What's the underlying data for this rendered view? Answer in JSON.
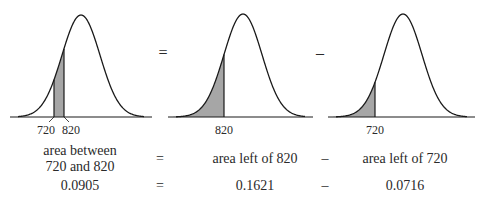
{
  "figure": {
    "panels": [
      {
        "id": "between",
        "shade": "between",
        "labels": [
          "720",
          "820"
        ]
      },
      {
        "id": "left-820",
        "shade": "left",
        "labels": [
          "820"
        ]
      },
      {
        "id": "left-720",
        "shade": "left",
        "labels": [
          "720"
        ]
      }
    ],
    "operators": {
      "top_eq": "=",
      "top_minus": "–"
    },
    "colors": {
      "curve": "#1a1a1a",
      "shade": "#a6a6a6",
      "background": "#ffffff"
    }
  },
  "equation_text": {
    "col1_line1": "area between",
    "col1_line2": "720 and 820",
    "eq": "=",
    "col2": "area left of 820",
    "minus": "–",
    "col3": "area left of 720"
  },
  "equation_values": {
    "col1": "0.0905",
    "eq": "=",
    "col2": "0.1621",
    "minus": "–",
    "col3": "0.0716"
  },
  "chart_data": {
    "type": "area",
    "panels": [
      {
        "shaded_region": "720 to 820",
        "x_ticks": [
          "720",
          "820"
        ],
        "area": 0.0905
      },
      {
        "shaded_region": "left of 820",
        "x_ticks": [
          "820"
        ],
        "area": 0.1621
      },
      {
        "shaded_region": "left of 720",
        "x_ticks": [
          "720"
        ],
        "area": 0.0716
      }
    ],
    "relation": "0.0905 = 0.1621 - 0.0716",
    "grid": false,
    "legend": "none"
  }
}
